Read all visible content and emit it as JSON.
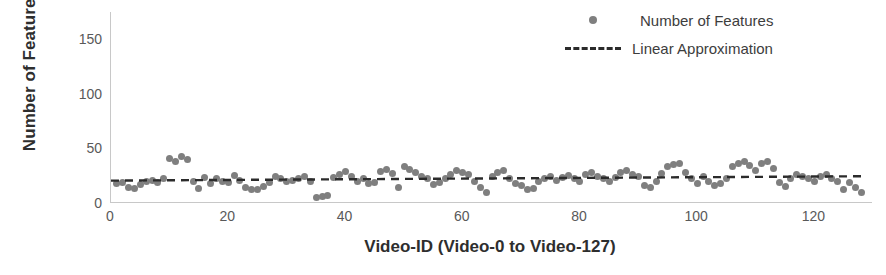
{
  "chart_data": {
    "type": "scatter",
    "title": "",
    "xlabel": "Video-ID (Video-0 to Video-127)",
    "ylabel": "Number of Features",
    "xlim": [
      0,
      130
    ],
    "ylim": [
      0,
      175
    ],
    "xticks": [
      0,
      20,
      40,
      60,
      80,
      100,
      120
    ],
    "yticks": [
      0,
      50,
      100,
      150
    ],
    "grid": false,
    "legend_position": "top-right",
    "series": [
      {
        "name": "Number of Features",
        "type": "scatter",
        "color": "#7f7f7f",
        "marker": "circle",
        "x": [
          1,
          2,
          3,
          4,
          5,
          6,
          7,
          8,
          9,
          10,
          11,
          12,
          13,
          14,
          15,
          16,
          17,
          18,
          19,
          20,
          21,
          22,
          23,
          24,
          25,
          26,
          27,
          28,
          29,
          30,
          31,
          32,
          33,
          34,
          35,
          36,
          37,
          38,
          39,
          40,
          41,
          42,
          43,
          44,
          45,
          46,
          47,
          48,
          49,
          50,
          51,
          52,
          53,
          54,
          55,
          56,
          57,
          58,
          59,
          60,
          61,
          62,
          63,
          64,
          65,
          66,
          67,
          68,
          69,
          70,
          71,
          72,
          73,
          74,
          75,
          76,
          77,
          78,
          79,
          80,
          81,
          82,
          83,
          84,
          85,
          86,
          87,
          88,
          89,
          90,
          91,
          92,
          93,
          94,
          95,
          96,
          97,
          98,
          99,
          100,
          101,
          102,
          103,
          104,
          105,
          106,
          107,
          108,
          109,
          110,
          111,
          112,
          113,
          114,
          115,
          116,
          117,
          118,
          119,
          120,
          121,
          122,
          123,
          124,
          125,
          126,
          127,
          128
        ],
        "y": [
          18,
          19,
          14,
          13,
          17,
          20,
          21,
          19,
          22,
          41,
          38,
          43,
          40,
          20,
          13,
          23,
          18,
          22,
          20,
          19,
          25,
          21,
          14,
          12,
          12,
          15,
          19,
          24,
          22,
          20,
          21,
          22,
          24,
          20,
          5,
          6,
          7,
          23,
          26,
          29,
          24,
          20,
          22,
          18,
          19,
          29,
          31,
          27,
          14,
          33,
          31,
          28,
          24,
          22,
          17,
          19,
          22,
          26,
          30,
          28,
          26,
          20,
          14,
          10,
          24,
          28,
          30,
          22,
          18,
          16,
          12,
          13,
          20,
          22,
          24,
          21,
          23,
          25,
          22,
          20,
          26,
          28,
          24,
          22,
          20,
          23,
          28,
          30,
          26,
          24,
          16,
          14,
          20,
          27,
          33,
          35,
          36,
          28,
          22,
          18,
          24,
          20,
          16,
          18,
          22,
          33,
          36,
          38,
          34,
          30,
          36,
          38,
          32,
          19,
          15,
          22,
          26,
          24,
          22,
          20,
          24,
          26,
          22,
          20,
          12,
          19,
          14,
          10
        ]
      },
      {
        "name": "Linear Approximation",
        "type": "line",
        "style": "dashed",
        "color": "#2b2b2b",
        "x": [
          0,
          128
        ],
        "y": [
          20.5,
          24.5
        ]
      }
    ]
  },
  "legend": {
    "items": [
      {
        "label": "Number of Features",
        "key": "marker"
      },
      {
        "label": "Linear Approximation",
        "key": "dashed-line"
      }
    ]
  }
}
